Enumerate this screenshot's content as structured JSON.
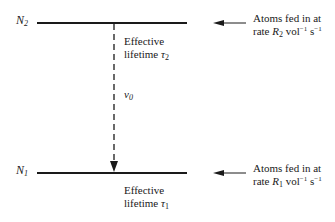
{
  "levels": {
    "upper": {
      "symbol": "N",
      "subscript": "2"
    },
    "lower": {
      "symbol": "N",
      "subscript": "1"
    }
  },
  "transition": {
    "symbol": "v",
    "subscript": "0"
  },
  "upper_lifetime": {
    "line1": "Effective",
    "line2": "lifetime ",
    "symbol": "τ",
    "subscript": "2"
  },
  "lower_lifetime": {
    "line1": "Effective",
    "line2": "lifetime ",
    "symbol": "τ",
    "subscript": "1"
  },
  "upper_feed": {
    "line1": "Atoms fed in at",
    "rate_prefix": "rate ",
    "rate_symbol": "R",
    "rate_subscript": "2",
    "unit1": " vol",
    "unit1_exp": "−1",
    "unit2": " s",
    "unit2_exp": "−1"
  },
  "lower_feed": {
    "line1": "Atoms fed in at",
    "rate_prefix": "rate ",
    "rate_symbol": "R",
    "rate_subscript": "1",
    "unit1": " vol",
    "unit1_exp": "−1",
    "unit2": " s",
    "unit2_exp": "−1"
  },
  "colors": {
    "line": "#1a1a1a",
    "text": "#1a1a1a",
    "background": "#ffffff"
  }
}
